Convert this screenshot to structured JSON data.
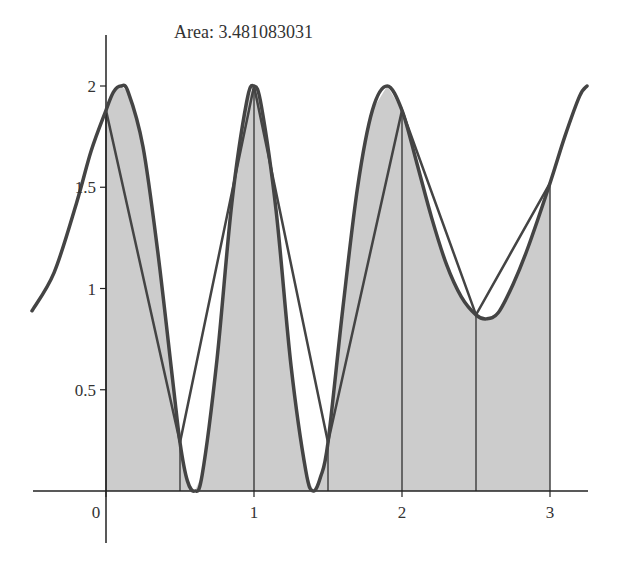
{
  "chart_data": {
    "type": "area",
    "title": "Area: 3.481083031",
    "xlabel": "",
    "ylabel": "",
    "xlim": [
      -0.5,
      3.25
    ],
    "ylim": [
      0,
      2.25
    ],
    "grid": false,
    "x_ticks": [
      "0",
      "1",
      "2",
      "3"
    ],
    "y_ticks": [
      "0.5",
      "1",
      "1.5",
      "2"
    ],
    "trapezoid_nodes": {
      "x": [
        0,
        0.5,
        1,
        1.5,
        2,
        2.5,
        3
      ],
      "y": [
        1.88,
        0.24,
        2.0,
        0.24,
        1.88,
        0.87,
        1.52
      ]
    },
    "curve": {
      "x": [
        -0.5,
        -0.35,
        -0.2,
        -0.1,
        0,
        0.05,
        0.1,
        0.15,
        0.25,
        0.35,
        0.45,
        0.5,
        0.55,
        0.6,
        0.65,
        0.75,
        0.85,
        0.95,
        1.0,
        1.05,
        1.15,
        1.25,
        1.35,
        1.4,
        1.45,
        1.5,
        1.6,
        1.7,
        1.8,
        1.9,
        2.0,
        2.1,
        2.2,
        2.3,
        2.4,
        2.5,
        2.57,
        2.65,
        2.75,
        2.85,
        3.0,
        3.1,
        3.2,
        3.25
      ],
      "y": [
        0.89,
        1.08,
        1.42,
        1.68,
        1.88,
        1.97,
        2.0,
        1.97,
        1.7,
        1.18,
        0.55,
        0.24,
        0.05,
        0.0,
        0.08,
        0.65,
        1.42,
        1.92,
        2.0,
        1.9,
        1.38,
        0.62,
        0.1,
        0.0,
        0.07,
        0.24,
        0.9,
        1.5,
        1.88,
        2.0,
        1.88,
        1.62,
        1.35,
        1.12,
        0.96,
        0.87,
        0.85,
        0.88,
        1.02,
        1.2,
        1.52,
        1.75,
        1.95,
        2.0
      ]
    },
    "annotations": [
      "Area: 3.481083031"
    ]
  },
  "colors": {
    "fill": "#cccccc",
    "curve": "#444444",
    "lines": "#444444",
    "axes": "#222222"
  }
}
